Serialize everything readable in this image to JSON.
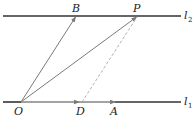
{
  "diagram": {
    "type": "vector geometry",
    "lines": [
      {
        "name": "l",
        "subscript": "2",
        "y": 16
      },
      {
        "name": "l",
        "subscript": "1",
        "y": 102
      }
    ],
    "points": {
      "O": {
        "label": "O",
        "x": 21,
        "y": 102
      },
      "B": {
        "label": "B",
        "x": 76,
        "y": 16
      },
      "P": {
        "label": "P",
        "x": 137,
        "y": 16
      },
      "D": {
        "label": "D",
        "x": 79,
        "y": 102
      },
      "A": {
        "label": "A",
        "x": 115,
        "y": 102
      }
    },
    "vectors": [
      "OB",
      "OP",
      "OD",
      "OA"
    ],
    "dashed_segments": [
      "DP"
    ],
    "colors": {
      "line": "#333333",
      "vector": "#7a7a7a",
      "dashed": "#aaaaaa",
      "text": "#222222"
    }
  },
  "labels": {
    "O": "O",
    "B": "B",
    "P": "P",
    "D": "D",
    "A": "A",
    "l2_name": "l",
    "l2_sub": "2",
    "l1_name": "l",
    "l1_sub": "1"
  }
}
